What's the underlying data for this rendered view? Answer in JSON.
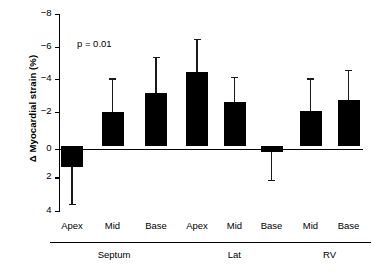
{
  "chart_data": {
    "type": "bar",
    "title": "",
    "xlabel": "",
    "ylabel": "Δ Myocardial strain (%)",
    "ylim": [
      -8,
      4
    ],
    "y_inverted": true,
    "grid": false,
    "legend": "none",
    "yticks": [
      -8,
      -6,
      -4,
      -2,
      0,
      2,
      4
    ],
    "ytick_labels": [
      "−8",
      "−6",
      "−4",
      "−2",
      "0",
      "2",
      "4"
    ],
    "annotations": [
      {
        "name": "p-value",
        "text": "p = 0.01"
      }
    ],
    "categories": [
      "Apex",
      "Mid",
      "Base",
      "Apex",
      "Mid",
      "Base",
      "Mid",
      "Base"
    ],
    "values": [
      1.3,
      -2.05,
      -3.2,
      -4.5,
      -2.65,
      0.35,
      -2.15,
      -2.8
    ],
    "errors_outer": [
      3.5,
      -4.1,
      -5.4,
      -6.5,
      -4.2,
      2.05,
      -4.1,
      -4.6
    ],
    "groups": [
      {
        "label": "Septum",
        "members": [
          "Apex",
          "Mid",
          "Base"
        ]
      },
      {
        "label": "Lat",
        "members": [
          "Apex",
          "Mid",
          "Base"
        ]
      },
      {
        "label": "RV",
        "members": [
          "Mid",
          "Base"
        ]
      }
    ],
    "bar_color": "#000000",
    "axis_color": "#000000",
    "background_color": "#ffffff"
  }
}
